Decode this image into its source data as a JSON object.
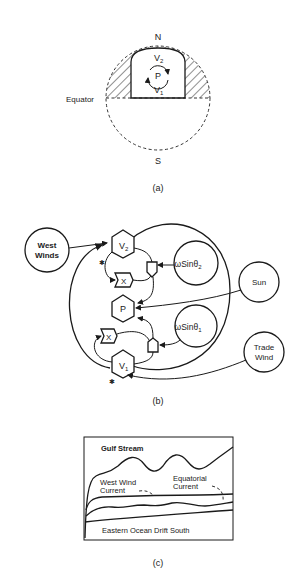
{
  "panel_a": {
    "caption": "(a)",
    "north": "N",
    "south": "S",
    "equator": "Equator",
    "v2": "V",
    "v2_sub": "2",
    "v1": "V",
    "v1_sub": "1",
    "p": "P"
  },
  "panel_b": {
    "caption": "(b)",
    "west_winds_line1": "West",
    "west_winds_line2": "Winds",
    "v2": "V",
    "v2_sub": "2",
    "v1": "V",
    "v1_sub": "1",
    "p": "P",
    "x_upper": "X",
    "x_lower": "X",
    "omega2": "ωSinθ",
    "omega2_sub": "2",
    "omega1": "ωSinθ",
    "omega1_sub": "1",
    "sun": "Sun",
    "trade_wind_line1": "Trade",
    "trade_wind_line2": "Wind"
  },
  "panel_c": {
    "caption": "(c)",
    "gulf_stream": "Gulf Stream",
    "west_wind_line1": "West Wind",
    "west_wind_line2": "Current",
    "equatorial_line1": "Equatorial",
    "equatorial_line2": "Current",
    "eastern_ocean": "Eastern Ocean Drift South"
  }
}
